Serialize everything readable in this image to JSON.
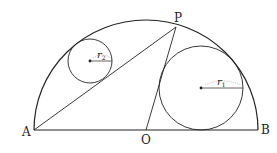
{
  "diagram": {
    "points": {
      "A": {
        "label": "A",
        "x": 34,
        "y": 130
      },
      "B": {
        "label": "B",
        "x": 258,
        "y": 130
      },
      "O": {
        "label": "O",
        "x": 146,
        "y": 130
      },
      "P": {
        "label": "P",
        "x": 176,
        "y": 27
      }
    },
    "circles": [
      {
        "name": "r1",
        "label": "r",
        "subscript": "1",
        "cx": 201,
        "cy": 88,
        "r": 42
      },
      {
        "name": "r2",
        "label": "r",
        "subscript": "2",
        "cx": 90,
        "cy": 61,
        "r": 22
      }
    ],
    "semicircle": {
      "center": "O",
      "rx": 112,
      "ry": 110
    },
    "segments": [
      "AB",
      "AP",
      "OP"
    ],
    "stroke_color": "#222222"
  }
}
